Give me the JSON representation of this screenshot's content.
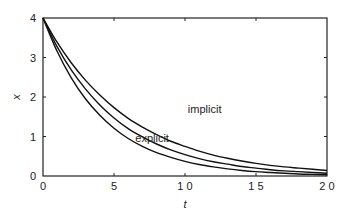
{
  "chart_data": {
    "type": "line",
    "title": "",
    "xlabel": "t",
    "ylabel": "x",
    "xlim": [
      0,
      20
    ],
    "ylim": [
      0,
      4
    ],
    "xticks": [
      0,
      5,
      10,
      15,
      20
    ],
    "xtick_labels": [
      "0",
      "5",
      "1 0",
      "1 5",
      "2 0"
    ],
    "yticks": [
      0,
      1,
      2,
      3,
      4
    ],
    "ytick_labels": [
      "0",
      "1",
      "2",
      "3",
      "4"
    ],
    "grid": false,
    "legend": null,
    "annotations": [
      {
        "text": "implicit",
        "x": 10.2,
        "y": 1.6
      },
      {
        "text": "explicit",
        "x": 6.5,
        "y": 0.85
      }
    ],
    "series": [
      {
        "name": "implicit",
        "x": [
          0,
          1,
          2,
          3,
          4,
          5,
          6,
          7,
          8,
          9,
          10,
          11,
          12,
          13,
          14,
          15,
          16,
          17,
          18,
          19,
          20
        ],
        "values": [
          4.0,
          3.38,
          2.86,
          2.42,
          2.05,
          1.73,
          1.46,
          1.24,
          1.05,
          0.88,
          0.75,
          0.63,
          0.53,
          0.45,
          0.38,
          0.32,
          0.27,
          0.23,
          0.2,
          0.17,
          0.14
        ]
      },
      {
        "name": "exact",
        "x": [
          0,
          1,
          2,
          3,
          4,
          5,
          6,
          7,
          8,
          9,
          10,
          11,
          12,
          13,
          14,
          15,
          16,
          17,
          18,
          19,
          20
        ],
        "values": [
          4.0,
          3.27,
          2.68,
          2.2,
          1.8,
          1.47,
          1.2,
          0.99,
          0.81,
          0.66,
          0.54,
          0.44,
          0.36,
          0.3,
          0.24,
          0.2,
          0.16,
          0.13,
          0.11,
          0.09,
          0.07
        ]
      },
      {
        "name": "explicit",
        "x": [
          0,
          1,
          2,
          3,
          4,
          5,
          6,
          7,
          8,
          9,
          10,
          11,
          12,
          13,
          14,
          15,
          16,
          17,
          18,
          19,
          20
        ],
        "values": [
          4.0,
          3.15,
          2.48,
          1.95,
          1.54,
          1.21,
          0.95,
          0.75,
          0.59,
          0.47,
          0.37,
          0.29,
          0.23,
          0.18,
          0.14,
          0.11,
          0.09,
          0.07,
          0.05,
          0.04,
          0.03
        ]
      }
    ]
  }
}
